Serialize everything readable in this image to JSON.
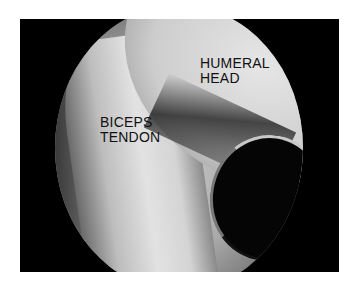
{
  "image": {
    "description": "Arthroscopic view of shoulder joint",
    "labels": {
      "humeral_head": [
        "HUMERAL",
        "HEAD"
      ],
      "biceps_tendon": [
        "BICEPS",
        "TENDON"
      ]
    },
    "colors": {
      "background": "#ffffff",
      "frame": "#000000",
      "label_text": "#111111"
    }
  }
}
